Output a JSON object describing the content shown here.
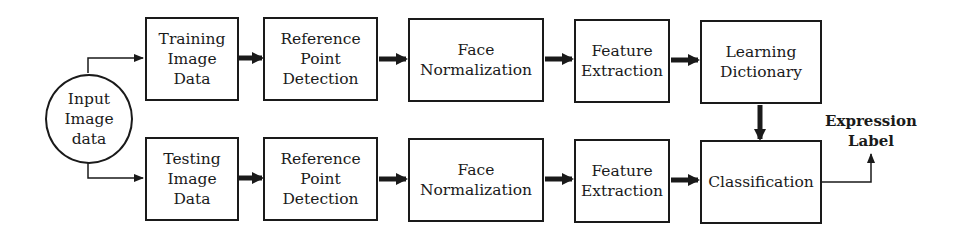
{
  "diagram": {
    "input": {
      "label": "Input\nImage\ndata"
    },
    "training_row": [
      {
        "id": "training-image-data",
        "label": "Training\nImage\nData"
      },
      {
        "id": "reference-point-detection-train",
        "label": "Reference\nPoint\nDetection"
      },
      {
        "id": "face-normalization-train",
        "label": "Face\nNormalization"
      },
      {
        "id": "feature-extraction-train",
        "label": "Feature\nExtraction"
      },
      {
        "id": "learning-dictionary",
        "label": "Learning\nDictionary"
      }
    ],
    "testing_row": [
      {
        "id": "testing-image-data",
        "label": "Testing\nImage\nData"
      },
      {
        "id": "reference-point-detection-test",
        "label": "Reference\nPoint\nDetection"
      },
      {
        "id": "face-normalization-test",
        "label": "Face\nNormalization"
      },
      {
        "id": "feature-extraction-test",
        "label": "Feature\nExtraction"
      },
      {
        "id": "classification",
        "label": "Classification"
      }
    ],
    "output": {
      "label": "Expression\nLabel"
    },
    "edges": [
      {
        "from": "input",
        "to": "training-image-data"
      },
      {
        "from": "input",
        "to": "testing-image-data"
      },
      {
        "from": "training-image-data",
        "to": "reference-point-detection-train"
      },
      {
        "from": "reference-point-detection-train",
        "to": "face-normalization-train"
      },
      {
        "from": "face-normalization-train",
        "to": "feature-extraction-train"
      },
      {
        "from": "feature-extraction-train",
        "to": "learning-dictionary"
      },
      {
        "from": "testing-image-data",
        "to": "reference-point-detection-test"
      },
      {
        "from": "reference-point-detection-test",
        "to": "face-normalization-test"
      },
      {
        "from": "face-normalization-test",
        "to": "feature-extraction-test"
      },
      {
        "from": "feature-extraction-test",
        "to": "classification"
      },
      {
        "from": "learning-dictionary",
        "to": "classification"
      },
      {
        "from": "classification",
        "to": "expression-label"
      }
    ]
  }
}
